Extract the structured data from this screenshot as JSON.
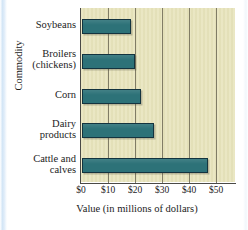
{
  "chart_data": {
    "type": "bar",
    "orientation": "horizontal",
    "title": "",
    "xlabel": "Value (in millions of dollars)",
    "ylabel": "Commodity",
    "categories": [
      "Soybeans",
      "Broilers (chickens)",
      "Corn",
      "Dairy products",
      "Cattle and calves"
    ],
    "values": [
      18,
      19.5,
      22,
      26.5,
      46.5
    ],
    "xlim": [
      0,
      57
    ],
    "xticks": [
      0,
      10,
      20,
      30,
      40,
      50
    ],
    "xtick_labels": [
      "$0",
      "$10",
      "$20",
      "$30",
      "$40",
      "$50"
    ],
    "grid": "vertical",
    "legend": "none",
    "bar_color": "#2d7278",
    "bar_edge_color": "#14343f",
    "plot_background": "#e8e4bc"
  },
  "axis": {
    "y_title": "Commodity",
    "x_title": "Value (in millions of dollars)"
  },
  "category_labels": [
    {
      "lines": [
        "Soybeans"
      ]
    },
    {
      "lines": [
        "Broilers",
        "(chickens)"
      ]
    },
    {
      "lines": [
        "Corn"
      ]
    },
    {
      "lines": [
        "Dairy",
        "products"
      ]
    },
    {
      "lines": [
        "Cattle and",
        "calves"
      ]
    }
  ],
  "xticks": [
    {
      "label": "$0"
    },
    {
      "label": "$10"
    },
    {
      "label": "$20"
    },
    {
      "label": "$30"
    },
    {
      "label": "$40"
    },
    {
      "label": "$50"
    }
  ]
}
